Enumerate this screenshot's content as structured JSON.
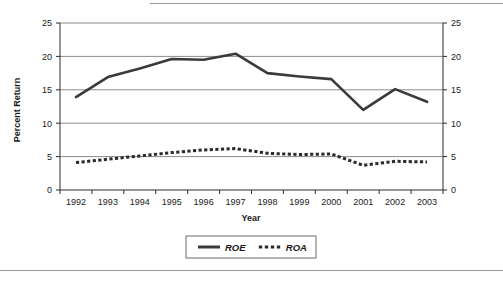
{
  "figure": {
    "name": "roe-roa-line-chart",
    "background": "#ffffff",
    "rules": {
      "top_rule": "horizontal-rule",
      "bottom_rule": "horizontal-rule"
    }
  },
  "chart_data": {
    "type": "line",
    "title": "",
    "xlabel": "Year",
    "ylabel": "Percent Return",
    "y2label": "",
    "categories": [
      "1992",
      "1993",
      "1994",
      "1995",
      "1996",
      "1997",
      "1998",
      "1999",
      "2000",
      "2001",
      "2002",
      "2003"
    ],
    "series": [
      {
        "name": "ROE",
        "style": "solid",
        "color": "#3a3a3a",
        "values": [
          13.9,
          16.9,
          18.2,
          19.6,
          19.5,
          20.4,
          17.5,
          17.0,
          16.6,
          12.0,
          15.1,
          13.2
        ]
      },
      {
        "name": "ROA",
        "style": "dotted",
        "color": "#2b2b2b",
        "values": [
          4.1,
          4.6,
          5.1,
          5.6,
          6.0,
          6.2,
          5.5,
          5.3,
          5.4,
          3.7,
          4.3,
          4.2
        ]
      }
    ],
    "ylim": [
      0,
      25
    ],
    "yticks": [
      0,
      5,
      10,
      15,
      20,
      25
    ],
    "ytick_labels": [
      "0",
      "5",
      "10",
      "15",
      "20",
      "25"
    ],
    "y2lim": [
      0,
      25
    ],
    "y2ticks": [
      0,
      5,
      10,
      15,
      20,
      25
    ],
    "y2tick_labels": [
      "0",
      "5",
      "10",
      "15",
      "20",
      "25"
    ],
    "grid": true,
    "grid_axis": "y",
    "grid_color": "#8c8c8c",
    "legend_position": "bottom-center",
    "legend_entries": [
      "ROE",
      "ROA"
    ]
  }
}
